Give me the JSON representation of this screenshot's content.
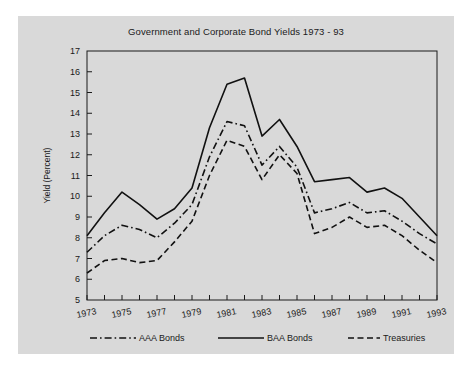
{
  "figure": {
    "background_color": "#d9d9d9",
    "page_background_color": "#ffffff",
    "line_color": "#111111"
  },
  "chart_data": {
    "type": "line",
    "title": "Government and Corporate Bond Yields 1973 - 93",
    "xlabel": "",
    "ylabel": "Yield (Percent)",
    "xlim": [
      1973,
      1993
    ],
    "ylim": [
      5,
      17
    ],
    "yticks": [
      5,
      6,
      7,
      8,
      9,
      10,
      11,
      12,
      13,
      14,
      15,
      16,
      17
    ],
    "ytick_labels": [
      "5",
      "6",
      "7",
      "8",
      "9",
      "10",
      "11",
      "12",
      "13",
      "14",
      "15",
      "16",
      "17"
    ],
    "xticks": [
      1973,
      1974,
      1975,
      1976,
      1977,
      1978,
      1979,
      1980,
      1981,
      1982,
      1983,
      1984,
      1985,
      1986,
      1987,
      1988,
      1989,
      1990,
      1991,
      1992,
      1993
    ],
    "xtick_labels_shown": [
      "1973",
      "1975",
      "1977",
      "1979",
      "1981",
      "1983",
      "1985",
      "1987",
      "1989",
      "1991",
      "1993"
    ],
    "grid": false,
    "legend_position": "bottom",
    "x": [
      1973,
      1974,
      1975,
      1976,
      1977,
      1978,
      1979,
      1980,
      1981,
      1982,
      1983,
      1984,
      1985,
      1986,
      1987,
      1988,
      1989,
      1990,
      1991,
      1992,
      1993
    ],
    "series": [
      {
        "name": "AAA Bonds",
        "style": "dashdot",
        "values": [
          7.3,
          8.1,
          8.6,
          8.4,
          8.0,
          8.7,
          9.6,
          11.9,
          13.6,
          13.4,
          11.5,
          12.4,
          11.4,
          9.2,
          9.4,
          9.7,
          9.2,
          9.3,
          8.8,
          8.2,
          7.7
        ]
      },
      {
        "name": "BAA Bonds",
        "style": "solid",
        "values": [
          8.1,
          9.2,
          10.2,
          9.6,
          8.9,
          9.4,
          10.4,
          13.3,
          15.4,
          15.7,
          12.9,
          13.7,
          12.4,
          10.7,
          10.8,
          10.9,
          10.2,
          10.4,
          9.9,
          9.0,
          8.1
        ]
      },
      {
        "name": "Treasuries",
        "style": "dashed",
        "values": [
          6.3,
          6.9,
          7.0,
          6.8,
          6.9,
          7.8,
          8.8,
          11.0,
          12.7,
          12.4,
          10.8,
          12.0,
          11.1,
          8.2,
          8.5,
          9.0,
          8.5,
          8.6,
          8.1,
          7.4,
          6.8
        ]
      }
    ]
  },
  "legend": {
    "items": [
      {
        "label": "AAA Bonds",
        "style": "dashdot"
      },
      {
        "label": "BAA Bonds",
        "style": "solid"
      },
      {
        "label": "Treasuries",
        "style": "dashed"
      }
    ]
  }
}
